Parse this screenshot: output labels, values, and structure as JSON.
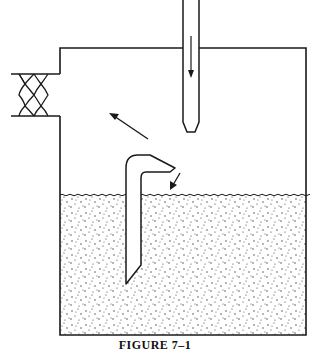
{
  "figure": {
    "caption": "FIGURE 7–1",
    "colors": {
      "line": "#1a1a1a",
      "background": "#ffffff",
      "stipple": "#333333"
    },
    "components": [
      {
        "name": "tank",
        "description": "open-top vessel with side outlet"
      },
      {
        "name": "inlet-pipe",
        "description": "vertical pipe entering from top with downward flow arrow"
      },
      {
        "name": "filter-mesh",
        "description": "crosshatched filter in left side outlet"
      },
      {
        "name": "bent-dip-tube",
        "description": "inverted-L tube partially submerged in liquid"
      },
      {
        "name": "liquid",
        "description": "stippled liquid filling lower part of tank"
      }
    ],
    "arrows": [
      {
        "name": "inlet-flow-arrow",
        "direction": "down"
      },
      {
        "name": "vapor-flow-arrow",
        "direction": "up-left toward outlet"
      },
      {
        "name": "dip-tube-discharge-arrow",
        "direction": "down-left toward liquid surface"
      }
    ]
  }
}
